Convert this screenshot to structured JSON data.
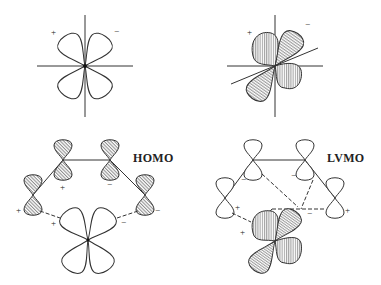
{
  "figure": {
    "panels": [
      {
        "id": "dxy-plain",
        "description": "d orbital, unshaded four-lobe clover with axes",
        "signs": [
          "+",
          "−"
        ]
      },
      {
        "id": "dxy-hatched",
        "description": "hybridized d orbital, hatched lobes with tilted axis",
        "signs": [
          "+",
          "−"
        ]
      },
      {
        "id": "homo",
        "label": "HOMO",
        "signs": [
          "+",
          "−",
          "+",
          "−",
          "+",
          "−"
        ]
      },
      {
        "id": "lvmo",
        "label": "LVMO",
        "signs": [
          "−",
          "−",
          "+",
          "+",
          "−",
          "+"
        ]
      }
    ],
    "homo_label": "HOMO",
    "lvmo_label": "LVMO",
    "sign_plus": "+",
    "sign_minus": "−"
  },
  "colors": {
    "stroke": "#333333",
    "hatch": "#555555",
    "background": "#ffffff"
  }
}
